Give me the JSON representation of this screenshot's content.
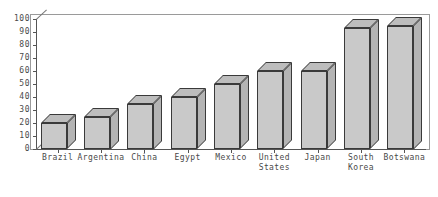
{
  "chart_data": {
    "type": "bar",
    "title": "",
    "subtitle": "",
    "xlabel": "",
    "ylabel": "",
    "categories": [
      "Brazil",
      "Argentina",
      "China",
      "Egypt",
      "Mexico",
      "United\nStates",
      "Japan",
      "South\nKorea",
      "Botswana"
    ],
    "values": [
      20,
      25,
      35,
      40,
      50,
      60,
      60,
      93,
      95
    ],
    "ylim": [
      0,
      100
    ],
    "yticks": [
      0,
      10,
      20,
      30,
      40,
      50,
      60,
      70,
      80,
      90,
      100
    ],
    "ytick_labels": [
      "0",
      "10",
      "20",
      "30",
      "40",
      "50",
      "60",
      "70",
      "80",
      "90",
      "100"
    ],
    "grid": false,
    "legend": "none",
    "style": "3d-bars",
    "bar_face_color": "#c9c9c9",
    "bar_top_color": "#bdbdbd",
    "bar_side_color": "#b4b4b4",
    "bar_edge_color": "#3a3a3a",
    "axis_color": "#555555",
    "frame_color": "#9a9a9a",
    "background": "#ffffff",
    "text_color": "#4a4a4a"
  }
}
